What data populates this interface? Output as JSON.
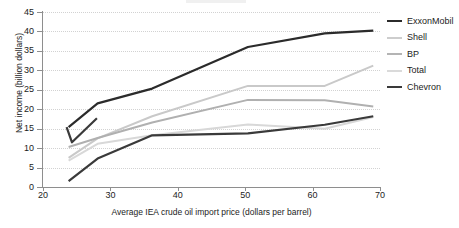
{
  "chart_data": {
    "type": "line",
    "title": "",
    "xlabel": "Average IEA crude oil import price (dollars per barrel)",
    "ylabel": "Net income (billion dollars)",
    "xlim": [
      20,
      70
    ],
    "ylim": [
      0,
      45
    ],
    "xticks": [
      20,
      30,
      40,
      50,
      60,
      70
    ],
    "yticks": [
      0,
      5,
      10,
      15,
      20,
      25,
      30,
      35,
      40,
      45
    ],
    "grid": "horizontal-dotted",
    "legend_position": "right",
    "series": [
      {
        "name": "ExxonMobil",
        "color": "#2b2b2b",
        "width": 2.2,
        "x": [
          23.8,
          28.1,
          36.2,
          50.4,
          61.8,
          69.0
        ],
        "y": [
          15.4,
          21.5,
          25.3,
          36.0,
          39.5,
          40.2
        ]
      },
      {
        "name": "Shell",
        "color": "#c9c9c9",
        "width": 2.0,
        "x": [
          23.8,
          28.1,
          36.2,
          50.4,
          61.8,
          69.0
        ],
        "y": [
          7.5,
          12.5,
          18.2,
          26.0,
          26.0,
          31.2
        ]
      },
      {
        "name": "BP",
        "color": "#b0b0b0",
        "width": 2.0,
        "x": [
          23.8,
          28.1,
          36.2,
          50.4,
          61.8,
          69.0
        ],
        "y": [
          10.3,
          12.6,
          16.6,
          22.4,
          22.3,
          20.7
        ]
      },
      {
        "name": "Total",
        "color": "#d8d8d8",
        "width": 2.0,
        "x": [
          23.8,
          28.1,
          36.2,
          50.4,
          61.8,
          69.0
        ],
        "y": [
          6.8,
          11.1,
          13.3,
          16.1,
          15.0,
          18.0
        ]
      },
      {
        "name": "Chevron",
        "color": "#3a3a3a",
        "width": 2.2,
        "x": [
          23.8,
          28.1,
          36.2,
          50.4,
          61.8,
          69.0
        ],
        "y": [
          1.5,
          7.3,
          13.3,
          13.8,
          16.0,
          18.2
        ]
      },
      {
        "name": "Chevron-early",
        "color": "#3a3a3a",
        "width": 2.2,
        "x": [
          23.5,
          24.3,
          28.0
        ],
        "y": [
          15.4,
          11.5,
          17.7
        ]
      }
    ]
  },
  "legend": {
    "items": [
      {
        "label": "ExxonMobil",
        "color": "#2b2b2b",
        "thickness": 2.4
      },
      {
        "label": "Shell",
        "color": "#cdcdcd",
        "thickness": 2.0
      },
      {
        "label": "BP",
        "color": "#b4b4b4",
        "thickness": 2.0
      },
      {
        "label": "Total",
        "color": "#dadada",
        "thickness": 2.0
      },
      {
        "label": "Chevron",
        "color": "#3a3a3a",
        "thickness": 2.4
      }
    ]
  },
  "axes": {
    "y_title": "Net income (billion dollars)",
    "x_title": "Average IEA crude oil import price (dollars per barrel)",
    "y_tick_labels": [
      "0",
      "5",
      "10",
      "15",
      "20",
      "25",
      "30",
      "35",
      "40",
      "45"
    ],
    "x_tick_labels": [
      "20",
      "30",
      "40",
      "50",
      "60",
      "70"
    ]
  }
}
